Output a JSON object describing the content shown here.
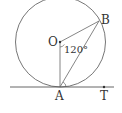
{
  "diagram": {
    "points": {
      "O": {
        "label": "O",
        "x": 60,
        "y": 42
      },
      "A": {
        "label": "A",
        "x": 60,
        "y": 87
      },
      "B": {
        "label": "B",
        "x": 99,
        "y": 21
      },
      "T": {
        "label": "T",
        "x": 104,
        "y": 87
      }
    },
    "circle": {
      "cx": 60.5,
      "cy": 42,
      "r": 45
    },
    "angle_label": "120°",
    "colors": {
      "stroke": "#555555",
      "text": "#333333"
    }
  }
}
